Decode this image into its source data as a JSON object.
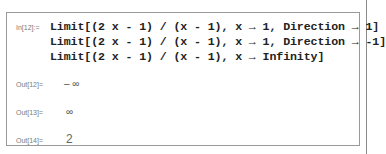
{
  "notebook": {
    "input": {
      "label": "In[12]:=",
      "lines": [
        "Limit[(2 x - 1) / (x - 1), x → 1, Direction → 1]",
        "Limit[(2 x - 1) / (x - 1), x → 1, Direction → -1]",
        "Limit[(2 x - 1) / (x - 1), x → Infinity]"
      ]
    },
    "outputs": [
      {
        "label": "Out[12]=",
        "value": "– ∞"
      },
      {
        "label": "Out[13]=",
        "value": "∞"
      },
      {
        "label": "Out[14]=",
        "value": "2"
      }
    ]
  }
}
